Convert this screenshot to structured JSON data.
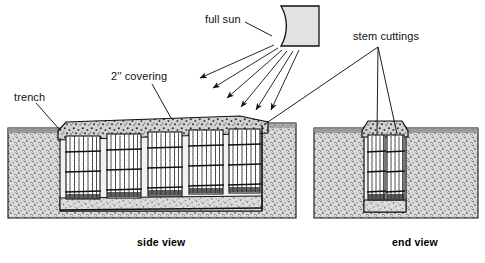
{
  "figure": {
    "style": "black-and-white line art with stippled soil texture",
    "background_color": "#ffffff",
    "ink_color": "#000000",
    "soil_fill_color": "#d8d8d8",
    "covering_fill_color": "#cfcfcf",
    "sun_fill_color": "#e2e2e2"
  },
  "labels": {
    "trench": "trench",
    "covering": "2'' covering",
    "full_sun": "full sun",
    "stem_cuttings": "stem cuttings"
  },
  "captions": {
    "side_view": "side view",
    "end_view": "end view"
  },
  "icons": {
    "sun": "sun-quarter-disc-icon",
    "ray": "sun-ray-arrow-icon",
    "leader": "leader-line-icon"
  },
  "diagram_data": {
    "views": [
      {
        "name": "side view",
        "caption": "side view",
        "bundle_count": 5,
        "description": "longitudinal section through trench showing five bundles of stem cuttings stood upright side by side, topped by a 2 inch covering mound"
      },
      {
        "name": "end view",
        "caption": "end view",
        "bundle_count": 2,
        "description": "transverse section through trench showing two bundles of stem cuttings side by side below a 2 inch covering mound"
      }
    ],
    "sun": {
      "label": "full sun",
      "shape": "quarter disc",
      "ray_count": 6,
      "ray_direction": "down-left"
    },
    "callouts": [
      {
        "label": "trench",
        "target": "side view trench wall"
      },
      {
        "label": "2'' covering",
        "target": "side view covering mound"
      },
      {
        "label": "full sun",
        "target": "sun symbol"
      },
      {
        "label": "stem cuttings",
        "target": "side view bundle and end view bundles",
        "leader_count": 3
      }
    ],
    "covering_depth": "2''"
  }
}
